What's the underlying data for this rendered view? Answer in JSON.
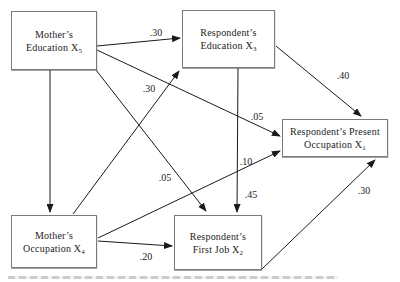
{
  "diagram": {
    "type": "path-model",
    "colors": {
      "background": "#ffffff",
      "box_border": "#7b7b7b",
      "arrow": "#1a1a1a",
      "text": "#1c1c1c"
    },
    "nodes": [
      {
        "id": "x5",
        "line1": "Mother’s",
        "line2": "Education X",
        "sub": "5"
      },
      {
        "id": "x3",
        "line1": "Respondent’s",
        "line2": "Education X",
        "sub": "3"
      },
      {
        "id": "x1",
        "line1": "Respondent’s Present",
        "line2": "Occupation X",
        "sub": "1"
      },
      {
        "id": "x4",
        "line1": "Mother’s",
        "line2": "Occupation X",
        "sub": "4"
      },
      {
        "id": "x2",
        "line1": "Respondent’s",
        "line2": "First Job X",
        "sub": "2"
      }
    ],
    "edges": [
      {
        "from": "x5",
        "to": "x3",
        "coef": ".30"
      },
      {
        "from": "x5",
        "to": "x4",
        "coef": ""
      },
      {
        "from": "x5",
        "to": "x1",
        "coef": ".05"
      },
      {
        "from": "x5",
        "to": "x2",
        "coef": ".05"
      },
      {
        "from": "x4",
        "to": "x3",
        "coef": ".30"
      },
      {
        "from": "x4",
        "to": "x1",
        "coef": ".10"
      },
      {
        "from": "x4",
        "to": "x2",
        "coef": ".20"
      },
      {
        "from": "x3",
        "to": "x2",
        "coef": ".45"
      },
      {
        "from": "x3",
        "to": "x1",
        "coef": ".40"
      },
      {
        "from": "x2",
        "to": "x1",
        "coef": ".30"
      }
    ]
  }
}
